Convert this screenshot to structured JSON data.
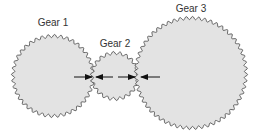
{
  "colors": {
    "gear_fill": "#e3e3e3",
    "gear_stroke": "#444444",
    "arrow": "#111111",
    "label": "#333333"
  },
  "gears": [
    {
      "label": "Gear 1",
      "cx": 53,
      "cy": 76,
      "r": 40,
      "teeth": 40,
      "label_x": 53,
      "label_y": 17
    },
    {
      "label": "Gear 2",
      "cx": 115,
      "cy": 76,
      "r": 23,
      "teeth": 22,
      "label_x": 115,
      "label_y": 38
    },
    {
      "label": "Gear 3",
      "cx": 191,
      "cy": 73,
      "r": 55,
      "teeth": 56,
      "label_x": 191,
      "label_y": 3
    }
  ],
  "arrows": [
    {
      "from": [
        74,
        77
      ],
      "to": [
        92,
        77
      ]
    },
    {
      "from": [
        113,
        77
      ],
      "to": [
        96,
        77
      ]
    },
    {
      "from": [
        118,
        77
      ],
      "to": [
        135,
        77
      ]
    },
    {
      "from": [
        160,
        77
      ],
      "to": [
        141,
        77
      ]
    }
  ]
}
